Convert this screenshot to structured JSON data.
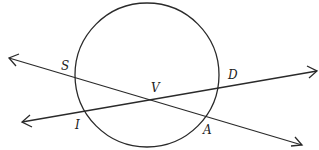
{
  "diagram": {
    "type": "geometry-circle-secants",
    "circle": {
      "cx": 147,
      "cy": 75,
      "r": 73
    },
    "lines": [
      {
        "name": "line-SA",
        "from": [
          8,
          58
        ],
        "to": [
          303,
          145
        ],
        "passes_through": [
          "S",
          "V",
          "A"
        ]
      },
      {
        "name": "line-ID",
        "from": [
          22,
          122
        ],
        "to": [
          317,
          71
        ],
        "passes_through": [
          "I",
          "V",
          "D"
        ]
      }
    ],
    "points": [
      {
        "label": "S",
        "x": 66,
        "y": 70
      },
      {
        "label": "V",
        "x": 154,
        "y": 92
      },
      {
        "label": "D",
        "x": 229,
        "y": 78
      },
      {
        "label": "I",
        "x": 76,
        "y": 128
      },
      {
        "label": "A",
        "x": 204,
        "y": 134
      }
    ],
    "colors": {
      "stroke": "#2a2a2a",
      "background": "#ffffff"
    }
  }
}
